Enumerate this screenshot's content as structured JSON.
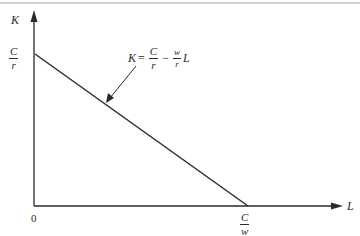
{
  "diagram": {
    "type": "budget-line / isocost",
    "axes": {
      "y_label": "K",
      "x_label": "L",
      "origin_label": "0"
    },
    "y_intercept": {
      "numerator": "C",
      "denominator": "r"
    },
    "x_intercept": {
      "numerator": "C",
      "denominator": "w"
    },
    "equation": {
      "lhs": "K",
      "eq": "=",
      "term1": {
        "numerator": "C",
        "denominator": "r"
      },
      "minus": "−",
      "term2": {
        "numerator": "w",
        "denominator": "r"
      },
      "var": "L"
    },
    "colors": {
      "line": "#2a2a2a",
      "border": "#9a9a9a"
    }
  }
}
